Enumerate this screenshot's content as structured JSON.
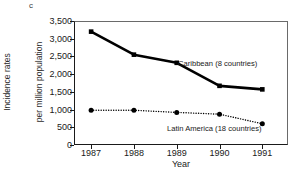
{
  "figure": {
    "panel_letter": "c",
    "background_color": "#ffffff",
    "ink_color": "#1a1a1a"
  },
  "chart_data": {
    "type": "line",
    "title": "",
    "subtitle": "",
    "panel_label": "c",
    "xlabel": "Year",
    "ylabel_line1": "Incidence rates",
    "ylabel_line2": "per million population",
    "categories": [
      "1987",
      "1988",
      "1989",
      "1990",
      "1991"
    ],
    "x": [
      1987,
      1988,
      1989,
      1990,
      1991
    ],
    "xlim": [
      1986.6,
      1991.6
    ],
    "ylim": [
      0,
      3500
    ],
    "yticks": [
      0,
      500,
      1000,
      1500,
      2000,
      2500,
      3000,
      3500
    ],
    "ytick_labels": [
      "0",
      "500",
      "1,000",
      "1,500",
      "2,000",
      "2,500",
      "3,000",
      "3,500"
    ],
    "grid": false,
    "legend_position": "inline-annotations",
    "series": [
      {
        "name": "Caribbean (8 countries)",
        "label": "Caribbean (8 countries)",
        "values": [
          3200,
          2550,
          2320,
          1670,
          1570
        ],
        "line_style": "solid",
        "line_width": 2.6,
        "marker": "square",
        "color": "#000000"
      },
      {
        "name": "Latin America (18 countries)",
        "label": "Latin America (18 countries)",
        "values": [
          980,
          980,
          920,
          870,
          600
        ],
        "line_style": "dotted",
        "line_width": 1.4,
        "marker": "circle",
        "color": "#000000"
      }
    ],
    "annotations": [
      {
        "text": "Caribbean (8 countries)",
        "series": "Caribbean (8 countries)"
      },
      {
        "text": "Latin America (18 countries)",
        "series": "Latin America (18 countries)"
      }
    ]
  }
}
